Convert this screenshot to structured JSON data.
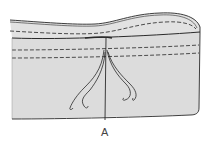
{
  "figure": {
    "caption": "A",
    "colors": {
      "fabric": "#dcdcdc",
      "fabric_inner": "#e4e4e4",
      "outline": "#2a2a2a",
      "stitch": "#3a3a3a",
      "background": "#ffffff"
    },
    "elements": {
      "stitch_lines": 3,
      "thread_tails": 2,
      "center_seam": true
    }
  }
}
